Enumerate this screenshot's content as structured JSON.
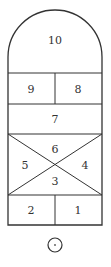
{
  "diagram": {
    "colors": {
      "line": "#333333",
      "text": "#333333",
      "background": "#ffffff"
    },
    "cells": [
      {
        "id": "cell-10",
        "label": "10",
        "x": 55,
        "y": 40
      },
      {
        "id": "cell-9",
        "label": "9",
        "x": 31,
        "y": 89
      },
      {
        "id": "cell-8",
        "label": "8",
        "x": 78,
        "y": 89
      },
      {
        "id": "cell-7",
        "label": "7",
        "x": 55,
        "y": 119
      },
      {
        "id": "cell-6",
        "label": "6",
        "x": 55,
        "y": 149
      },
      {
        "id": "cell-5",
        "label": "5",
        "x": 25,
        "y": 165
      },
      {
        "id": "cell-4",
        "label": "4",
        "x": 85,
        "y": 165
      },
      {
        "id": "cell-3",
        "label": "3",
        "x": 55,
        "y": 181
      },
      {
        "id": "cell-2",
        "label": "2",
        "x": 31,
        "y": 210
      },
      {
        "id": "cell-1",
        "label": "1",
        "x": 78,
        "y": 210
      }
    ],
    "start_marker": {
      "shape": "circle-with-dot",
      "cx": 55,
      "cy": 245,
      "r": 7
    }
  }
}
